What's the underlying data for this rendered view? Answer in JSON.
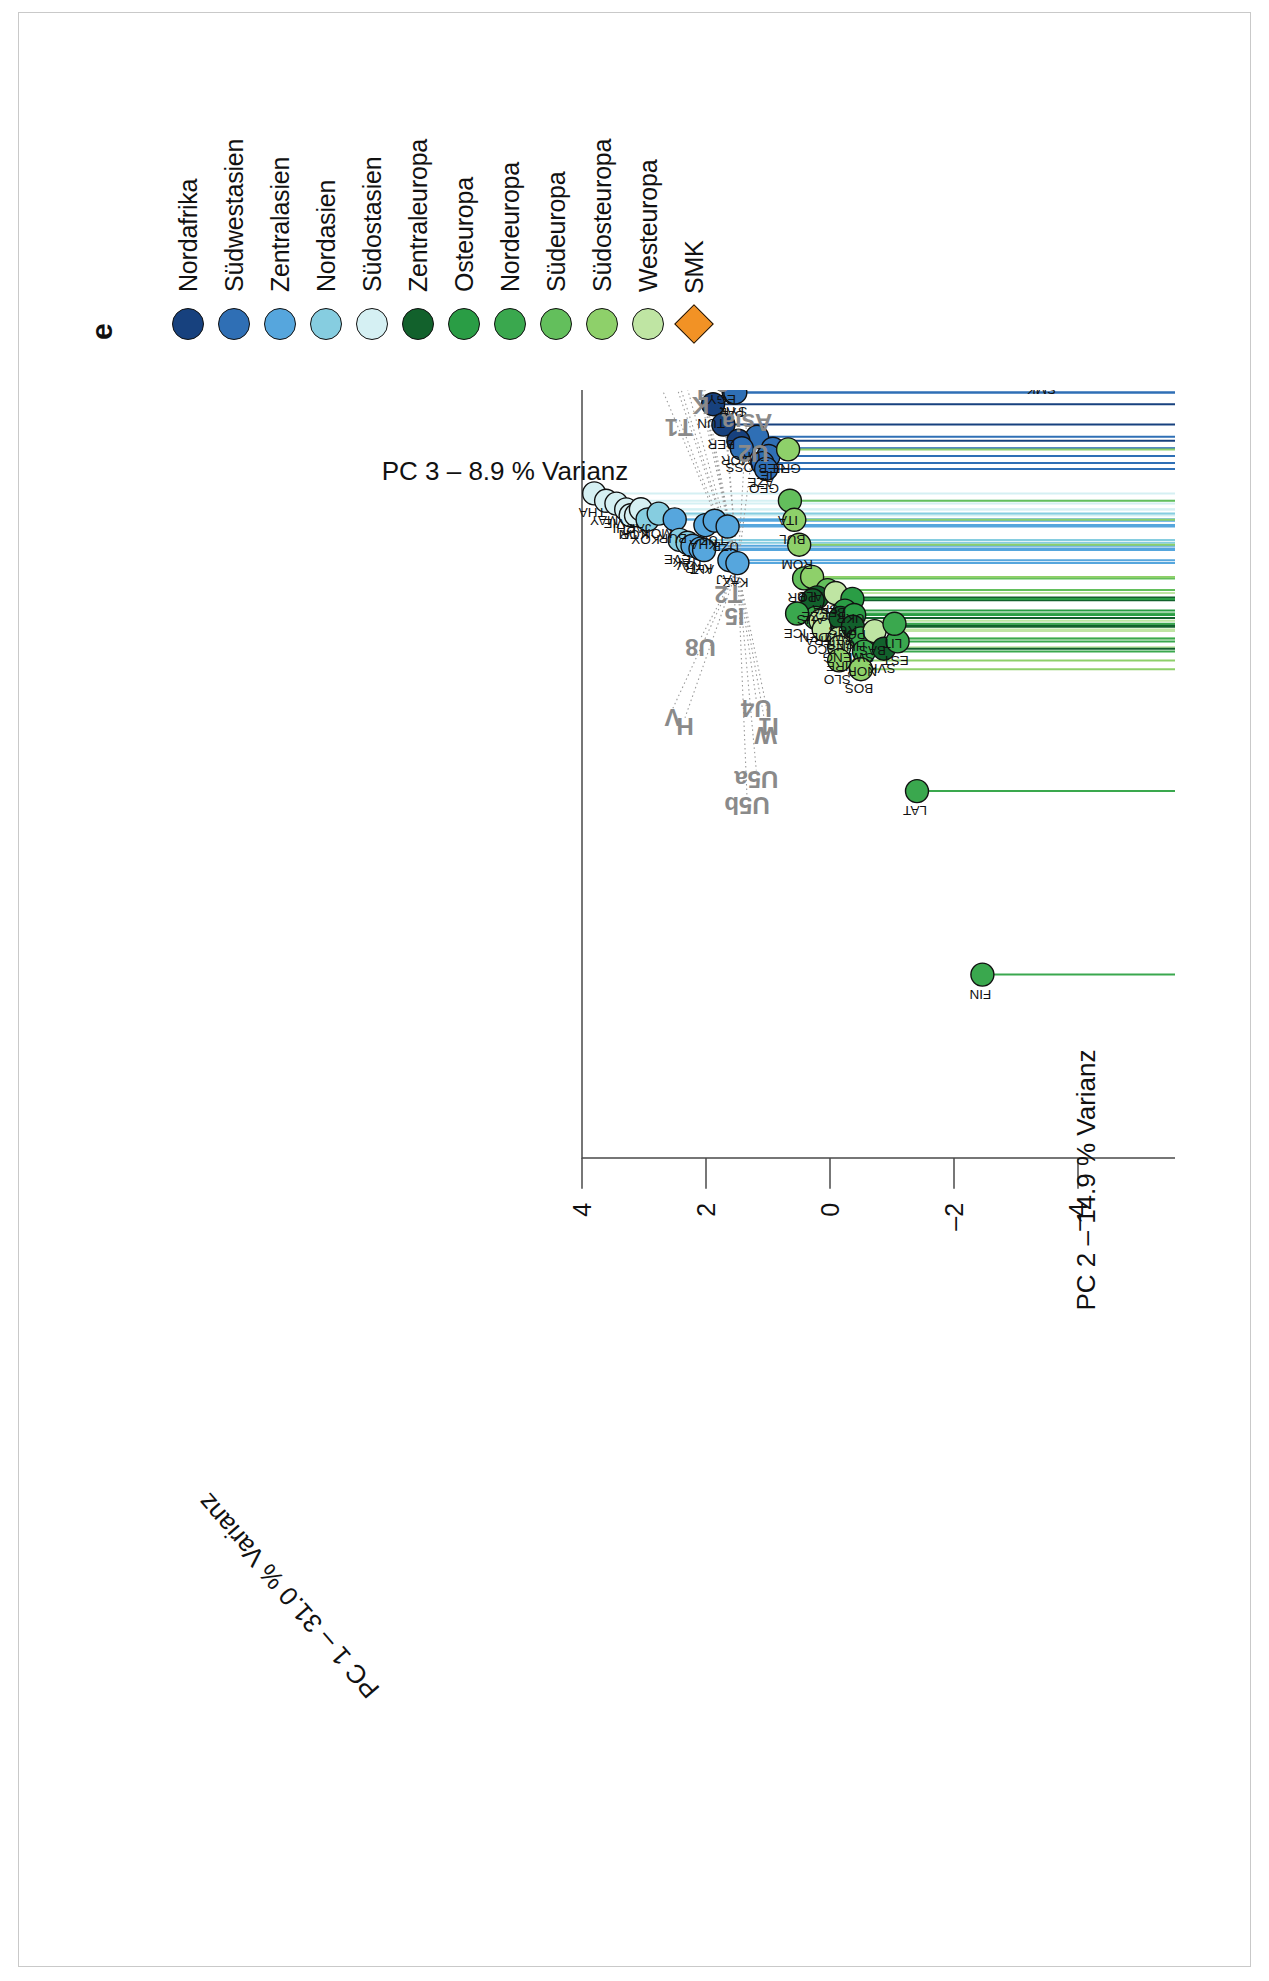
{
  "panel": {
    "label": "e"
  },
  "axes": {
    "pc1": {
      "title": "PC 1 – 31.0 % Varianz",
      "ticks": [
        -4,
        -2,
        0,
        2,
        4,
        6
      ]
    },
    "pc2": {
      "title": "PC 2 – 14.9 % Varianz",
      "ticks": [
        -6,
        -4,
        -2,
        0,
        2,
        4,
        6
      ]
    },
    "pc3": {
      "title": "PC 3 – 8.9 % Varianz",
      "ticks": [
        4,
        2,
        0,
        -2,
        -4,
        -6,
        -8,
        -10
      ]
    }
  },
  "legend": {
    "items": [
      {
        "label": "Nordafrika",
        "color": "#17417e",
        "shape": "circle"
      },
      {
        "label": "Südwestasien",
        "color": "#2f6fb5",
        "shape": "circle"
      },
      {
        "label": "Zentralasien",
        "color": "#56a6dd",
        "shape": "circle"
      },
      {
        "label": "Nordasien",
        "color": "#86cde0",
        "shape": "circle"
      },
      {
        "label": "Südostasien",
        "color": "#d5f0f3",
        "shape": "circle"
      },
      {
        "label": "Zentraleuropa",
        "color": "#12612c",
        "shape": "circle"
      },
      {
        "label": "Osteuropa",
        "color": "#2a9d45",
        "shape": "circle"
      },
      {
        "label": "Nordeuropa",
        "color": "#3aa84e",
        "shape": "circle"
      },
      {
        "label": "Südeuropa",
        "color": "#63bf5c",
        "shape": "circle"
      },
      {
        "label": "Südosteuropa",
        "color": "#8ed06a",
        "shape": "circle"
      },
      {
        "label": "Westeuropa",
        "color": "#bfe5a3",
        "shape": "circle"
      },
      {
        "label": "SMK",
        "color": "#f29225",
        "shape": "diamond"
      }
    ]
  },
  "chart_data": {
    "type": "scatter",
    "title": "",
    "xlabel": "PC 2 – 14.9 % Varianz",
    "ylabel": "PC 3 – 8.9 % Varianz",
    "zlabel": "PC 1 – 31.0 % Varianz",
    "xlim": [
      -6,
      6
    ],
    "ylim": [
      -10,
      4
    ],
    "zlim": [
      -4,
      6
    ],
    "grid": false,
    "legend_position": "right",
    "group_annotations": [
      {
        "text": "HV",
        "x": -5.55,
        "y": 3.55
      },
      {
        "text": "U",
        "x": -4.95,
        "y": 3.05
      },
      {
        "text": "Africa",
        "x": -4.0,
        "y": 2.95
      },
      {
        "text": "U3",
        "x": -4.2,
        "y": 2.35
      },
      {
        "text": "other",
        "x": -3.8,
        "y": 3.25
      },
      {
        "text": "X",
        "x": -3.6,
        "y": 2.15
      },
      {
        "text": "N",
        "x": -2.9,
        "y": 1.6
      },
      {
        "text": "J",
        "x": -2.65,
        "y": 1.85
      },
      {
        "text": "K",
        "x": -2.5,
        "y": 1.9
      },
      {
        "text": "a",
        "x": -2.7,
        "y": 1.55
      },
      {
        "text": "T1",
        "x": -2.25,
        "y": 2.25
      },
      {
        "text": "Asia",
        "x": -2.3,
        "y": 1.15
      },
      {
        "text": "U2",
        "x": -1.95,
        "y": 1.05
      },
      {
        "text": "T2",
        "x": -0.35,
        "y": 1.45
      },
      {
        "text": "I5",
        "x": -0.1,
        "y": 1.35
      },
      {
        "text": "U8",
        "x": 0.25,
        "y": 1.9
      },
      {
        "text": "U4",
        "x": 0.95,
        "y": 1.0
      },
      {
        "text": "W",
        "x": 1.25,
        "y": 0.85
      },
      {
        "text": "I1",
        "x": 1.15,
        "y": 0.8
      },
      {
        "text": "H",
        "x": 1.15,
        "y": 2.15
      },
      {
        "text": "V",
        "x": 1.05,
        "y": 2.35
      },
      {
        "text": "U5a",
        "x": 1.75,
        "y": 1.0
      },
      {
        "text": "U5b",
        "x": 2.05,
        "y": 1.15
      }
    ],
    "points": [
      {
        "label": "HV",
        "group": "Nordafrika",
        "x": -5.6,
        "y": 3.6,
        "z": -0.4,
        "hidden": true
      },
      {
        "label": "IRQ",
        "group": "Südwestasien",
        "x": -5.45,
        "y": 3.55,
        "z": -0.45
      },
      {
        "label": "YEM",
        "group": "Südwestasien",
        "x": -5.4,
        "y": 3.3,
        "z": -1.25
      },
      {
        "label": "DRZ",
        "group": "Nordafrika",
        "x": -5.95,
        "y": 3.55,
        "z": -0.3
      },
      {
        "label": "JOR",
        "group": "Südwestasien",
        "x": -5.6,
        "y": 2.9,
        "z": -2.3
      },
      {
        "label": "SAU",
        "group": "Südwestasien",
        "x": -4.55,
        "y": 2.6,
        "z": -1.4
      },
      {
        "label": "IRA",
        "group": "Südwestasien",
        "x": -4.4,
        "y": 2.45,
        "z": -1.6
      },
      {
        "label": "KUW",
        "group": "Südwestasien",
        "x": -3.95,
        "y": 3.25,
        "z": -1.1
      },
      {
        "label": "UAE",
        "group": "Südwestasien",
        "x": -3.85,
        "y": 3.55,
        "z": -1.0
      },
      {
        "label": "EGY",
        "group": "Nordafrika",
        "x": -3.85,
        "y": 2.95,
        "z": -2.95
      },
      {
        "label": "PAL",
        "group": "Südwestasien",
        "x": -3.55,
        "y": 2.6,
        "z": -2.5
      },
      {
        "label": "SYR",
        "group": "Südwestasien",
        "x": -3.45,
        "y": 2.45,
        "z": -2.2
      },
      {
        "label": "ARM",
        "group": "Südwestasien",
        "x": -4.1,
        "y": 1.95,
        "z": -3.05
      },
      {
        "label": "TUN",
        "group": "Nordafrika",
        "x": -3.35,
        "y": 2.85,
        "z": -2.3
      },
      {
        "label": "TUR",
        "group": "Südwestasien",
        "x": -3.15,
        "y": 2.35,
        "z": -2.8
      },
      {
        "label": "BER",
        "group": "Nordafrika",
        "x": -3.05,
        "y": 2.6,
        "z": -2.1
      },
      {
        "label": "LEB",
        "group": "Südwestasien",
        "x": -3.1,
        "y": 2.2,
        "z": -3.05
      },
      {
        "label": "IE",
        "group": "Südwestasien",
        "x": -3.0,
        "y": 2.25,
        "z": -3.0
      },
      {
        "label": "MOR",
        "group": "Nordafrika",
        "x": -2.9,
        "y": 2.4,
        "z": -2.2
      },
      {
        "label": "OSS",
        "group": "Südwestasien",
        "x": -2.9,
        "y": 2.45,
        "z": -2.45
      },
      {
        "label": "AZE",
        "group": "Südwestasien",
        "x": -2.8,
        "y": 2.2,
        "z": -2.65
      },
      {
        "label": "GEO",
        "group": "Südwestasien",
        "x": -2.7,
        "y": 2.1,
        "z": -2.55
      },
      {
        "label": "THA",
        "group": "Südostasien",
        "x": -2.2,
        "y": 4.6,
        "z": -1.9
      },
      {
        "label": "MAY",
        "group": "Südostasien",
        "x": -2.15,
        "y": 4.45,
        "z": -2.0
      },
      {
        "label": "VIE",
        "group": "Südostasien",
        "x": -2.05,
        "y": 4.2,
        "z": -1.8
      },
      {
        "label": "CHI",
        "group": "Südostasien",
        "x": -1.95,
        "y": 4.0,
        "z": -1.7
      },
      {
        "label": "TAI",
        "group": "Südostasien",
        "x": -1.9,
        "y": 3.95,
        "z": -1.75
      },
      {
        "label": "KOR",
        "group": "Südostasien",
        "x": -1.85,
        "y": 3.8,
        "z": -1.6
      },
      {
        "label": "JAP",
        "group": "Südostasien",
        "x": -1.9,
        "y": 3.7,
        "z": -1.55
      },
      {
        "label": "KOY",
        "group": "Nordasien",
        "x": -1.75,
        "y": 3.55,
        "z": -1.45
      },
      {
        "label": "MON",
        "group": "Nordasien",
        "x": -1.8,
        "y": 3.35,
        "z": -1.4
      },
      {
        "label": "BUR",
        "group": "Zentralasien",
        "x": -1.7,
        "y": 3.05,
        "z": -1.3
      },
      {
        "label": "EVE",
        "group": "Nordasien",
        "x": -1.45,
        "y": 2.95,
        "z": -1.25
      },
      {
        "label": "YAK",
        "group": "Nordasien",
        "x": -1.4,
        "y": 2.8,
        "z": -1.2
      },
      {
        "label": "TUV",
        "group": "Zentralasien",
        "x": -1.35,
        "y": 2.7,
        "z": -1.15
      },
      {
        "label": "KYR",
        "group": "Zentralasien",
        "x": -1.3,
        "y": 2.55,
        "z": -1.1
      },
      {
        "label": "ALT",
        "group": "Zentralasien",
        "x": -1.25,
        "y": 2.45,
        "z": -1.0
      },
      {
        "label": "KHA",
        "group": "Zentralasien",
        "x": -1.55,
        "y": 2.45,
        "z": -1.05
      },
      {
        "label": "TUK",
        "group": "Zentralasien",
        "x": -1.6,
        "y": 2.3,
        "z": -1.05
      },
      {
        "label": "UZB",
        "group": "Zentralasien",
        "x": -1.5,
        "y": 2.05,
        "z": -0.95
      },
      {
        "label": "TAJ",
        "group": "Zentralasien",
        "x": -1.1,
        "y": 2.0,
        "z": -0.9
      },
      {
        "label": "KAZ",
        "group": "Zentralasien",
        "x": -1.05,
        "y": 1.85,
        "z": -0.85
      },
      {
        "label": "GRE",
        "group": "Südosteuropa",
        "x": -1.95,
        "y": 0.55,
        "z": 0.3
      },
      {
        "label": "ITA",
        "group": "Südeuropa",
        "x": -1.35,
        "y": 0.5,
        "z": 0.35
      },
      {
        "label": "BUL",
        "group": "Südosteuropa",
        "x": -1.15,
        "y": 0.45,
        "z": 0.3
      },
      {
        "label": "ROM",
        "group": "Südosteuropa",
        "x": -0.85,
        "y": 0.35,
        "z": 0.35
      },
      {
        "label": "POR",
        "group": "Südeuropa",
        "x": -0.45,
        "y": 0.25,
        "z": 0.4
      },
      {
        "label": "ALB",
        "group": "Südosteuropa",
        "x": -0.45,
        "y": 0.1,
        "z": 0.45
      },
      {
        "label": "SPA",
        "group": "Südeuropa",
        "x": -0.3,
        "y": -0.15,
        "z": 0.45
      },
      {
        "label": "CZE",
        "group": "Zentraleuropa",
        "x": -0.2,
        "y": 0.0,
        "z": 0.5
      },
      {
        "label": "AUS",
        "group": "Zentraleuropa",
        "x": -0.15,
        "y": 0.05,
        "z": 0.55
      },
      {
        "label": "BEL",
        "group": "Westeuropa",
        "x": -0.25,
        "y": -0.3,
        "z": 0.5
      },
      {
        "label": "UKR",
        "group": "Osteuropa",
        "x": -0.2,
        "y": -0.55,
        "z": 0.45
      },
      {
        "label": "RUS",
        "group": "Osteuropa",
        "x": -0.05,
        "y": -0.45,
        "z": 0.5
      },
      {
        "label": "DEN",
        "group": "Nordeuropa",
        "x": 0.05,
        "y": 0.0,
        "z": 0.55
      },
      {
        "label": "FRA",
        "group": "Westeuropa",
        "x": 0.1,
        "y": -0.1,
        "z": 0.6
      },
      {
        "label": "SCO",
        "group": "Westeuropa",
        "x": 0.2,
        "y": -0.15,
        "z": 0.6
      },
      {
        "label": "ICE",
        "group": "Nordeuropa",
        "x": 0.0,
        "y": 0.3,
        "z": 0.55
      },
      {
        "label": "GER",
        "group": "Zentraleuropa",
        "x": 0.15,
        "y": -0.45,
        "z": 0.6
      },
      {
        "label": "SWZ",
        "group": "Zentraleuropa",
        "x": 0.05,
        "y": -0.4,
        "z": 0.55
      },
      {
        "label": "ENG",
        "group": "Westeuropa",
        "x": 0.3,
        "y": -0.4,
        "z": 0.6
      },
      {
        "label": "IRE",
        "group": "Westeuropa",
        "x": 0.4,
        "y": -0.4,
        "z": 0.6
      },
      {
        "label": "POL",
        "group": "Osteuropa",
        "x": 0.0,
        "y": -0.6,
        "z": 0.5
      },
      {
        "label": "HUN",
        "group": "Zentraleuropa",
        "x": 0.15,
        "y": -0.6,
        "z": 0.55
      },
      {
        "label": "SWE",
        "group": "Nordeuropa",
        "x": 0.3,
        "y": -0.75,
        "z": 0.6
      },
      {
        "label": "NOR",
        "group": "Nordeuropa",
        "x": 0.45,
        "y": -0.8,
        "z": 0.6
      },
      {
        "label": "SLO",
        "group": "Südosteuropa",
        "x": 0.55,
        "y": -0.4,
        "z": 0.6
      },
      {
        "label": "BOS",
        "group": "Südosteuropa",
        "x": 0.65,
        "y": -0.75,
        "z": 0.6
      },
      {
        "label": "BAS",
        "group": "Westeuropa",
        "x": 0.2,
        "y": -0.95,
        "z": 0.55
      },
      {
        "label": "SVK",
        "group": "Zentraleuropa",
        "x": 0.4,
        "y": -1.1,
        "z": 0.55
      },
      {
        "label": "EST",
        "group": "Nordeuropa",
        "x": 0.3,
        "y": -1.3,
        "z": 0.5
      },
      {
        "label": "LIT",
        "group": "Nordeuropa",
        "x": 0.1,
        "y": -1.25,
        "z": 0.5
      },
      {
        "label": "LAT",
        "group": "Nordeuropa",
        "x": 1.95,
        "y": -1.55,
        "z": 0.35
      },
      {
        "label": "FIN",
        "group": "Nordeuropa",
        "x": 3.95,
        "y": -2.5,
        "z": 0.1
      },
      {
        "label": "SMK",
        "group": "SMK",
        "x": -4.05,
        "y": -2.1,
        "z": -3.2,
        "shape": "diamond"
      }
    ]
  }
}
